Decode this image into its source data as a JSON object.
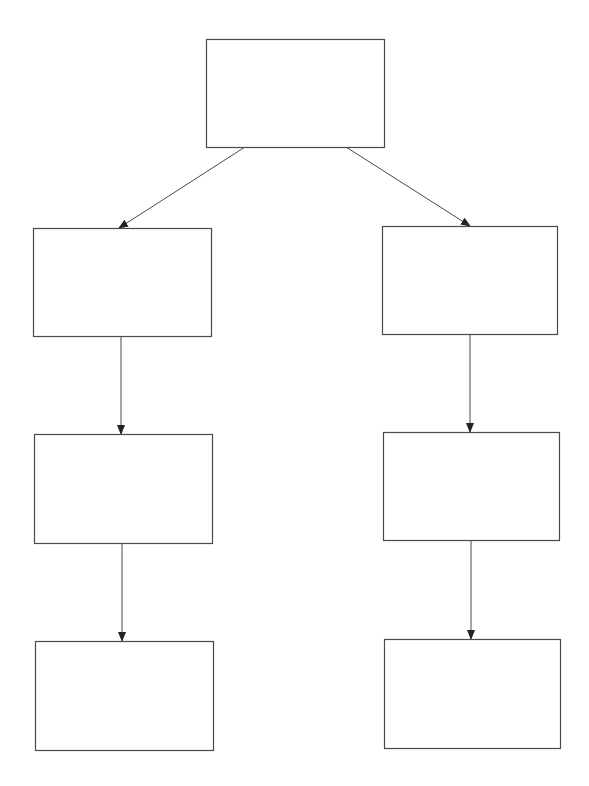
{
  "diagram": {
    "type": "tree",
    "stroke_color": "#4a4a4a",
    "background": "#ffffff",
    "nodes": [
      {
        "id": "root",
        "label": "",
        "x": 206,
        "y": 39,
        "w": 178,
        "h": 108
      },
      {
        "id": "left-1",
        "label": "",
        "x": 33,
        "y": 228,
        "w": 178,
        "h": 108
      },
      {
        "id": "left-2",
        "label": "",
        "x": 34,
        "y": 434,
        "w": 178,
        "h": 109
      },
      {
        "id": "left-3",
        "label": "",
        "x": 35,
        "y": 641,
        "w": 178,
        "h": 109
      },
      {
        "id": "right-1",
        "label": "",
        "x": 382,
        "y": 226,
        "w": 175,
        "h": 108
      },
      {
        "id": "right-2",
        "label": "",
        "x": 383,
        "y": 432,
        "w": 176,
        "h": 108
      },
      {
        "id": "right-3",
        "label": "",
        "x": 384,
        "y": 639,
        "w": 176,
        "h": 109
      }
    ],
    "edges": [
      {
        "from": "root",
        "to": "left-1",
        "x1": 245,
        "y1": 147,
        "x2": 119,
        "y2": 228
      },
      {
        "from": "root",
        "to": "right-1",
        "x1": 346,
        "y1": 147,
        "x2": 470,
        "y2": 226
      },
      {
        "from": "left-1",
        "to": "left-2",
        "x1": 121,
        "y1": 336,
        "x2": 121,
        "y2": 434
      },
      {
        "from": "left-2",
        "to": "left-3",
        "x1": 122,
        "y1": 543,
        "x2": 122,
        "y2": 641
      },
      {
        "from": "right-1",
        "to": "right-2",
        "x1": 470,
        "y1": 334,
        "x2": 470,
        "y2": 432
      },
      {
        "from": "right-2",
        "to": "right-3",
        "x1": 471,
        "y1": 540,
        "x2": 471,
        "y2": 639
      }
    ]
  }
}
